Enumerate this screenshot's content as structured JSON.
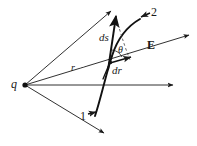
{
  "figure": {
    "background_color": "#ffffff",
    "stroke_color": "#1a1a1a",
    "width": 197,
    "height": 146,
    "labels": {
      "charge": "q",
      "radial_distance": "r",
      "path_element": "ds",
      "radial_element": "dr",
      "angle": "θ",
      "field": "E",
      "point_one": "1",
      "point_two": "2"
    },
    "elements": {
      "charge_point": "point-charge-q",
      "ray_upper": "field-line-upper",
      "ray_radial": "field-line-radial-r",
      "ray_horizontal": "field-line-horizontal",
      "ray_lower": "field-line-lower",
      "path_curve": "path-curve-1-to-2",
      "vector_ds": "vector-ds",
      "vector_dr": "vector-dr",
      "dashed_projection": "dashed-projection-line",
      "angle_arc": "angle-arc-theta"
    }
  }
}
